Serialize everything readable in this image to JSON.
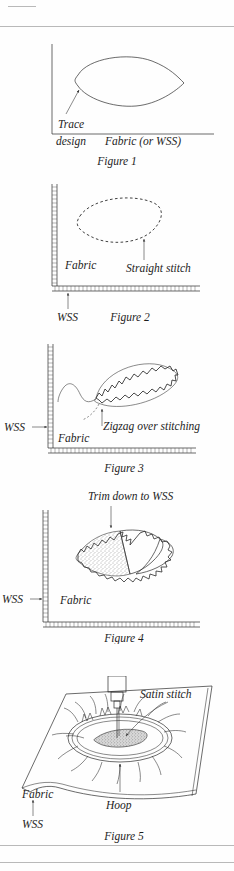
{
  "page": {
    "background": "#fefefe",
    "ink_color": "#2b2b2b",
    "rules": [
      {
        "name": "top-short-rule",
        "x": 8,
        "y": 6,
        "width": 28
      },
      {
        "name": "top-full-rule",
        "x": 0,
        "y": 26,
        "width": 234
      },
      {
        "name": "bottom-rule-1",
        "x": 0,
        "y": 845,
        "width": 234
      },
      {
        "name": "bottom-rule-2",
        "x": 0,
        "y": 862,
        "width": 234
      }
    ]
  },
  "figures": [
    {
      "id": "figure-1",
      "caption": "Figure 1",
      "labels": {
        "trace_line1": "Trace",
        "trace_line2": "design",
        "fabric": "Fabric (or WSS)"
      },
      "shape": "leaf-outline-solid",
      "edge_style": "plain-thin-lines",
      "arrows": [
        "trace-design-arrow-to-leaf"
      ]
    },
    {
      "id": "figure-2",
      "caption": "Figure 2",
      "labels": {
        "fabric": "Fabric",
        "straight_stitch": "Straight stitch",
        "wss": "WSS"
      },
      "shape": "leaf-outline-dashed",
      "edge_style": "hatched-double-lines",
      "arrows": [
        "straight-stitch-arrow-up",
        "wss-arrow-up"
      ]
    },
    {
      "id": "figure-3",
      "caption": "Figure 3",
      "labels": {
        "wss": "WSS",
        "fabric": "Fabric",
        "zigzag": "Zigzag over stitching"
      },
      "shape": "leaf-outline-zigzag",
      "edge_style": "hatched-double-lines",
      "arrows": [
        "wss-arrow-right",
        "zigzag-arrow-up"
      ]
    },
    {
      "id": "figure-4",
      "caption": "Figure 4",
      "labels": {
        "trim": "Trim down to WSS",
        "wss": "WSS",
        "fabric": "Fabric"
      },
      "shape": "leaf-zigzag-with-stippled-half-and-flap",
      "edge_style": "hatched-double-lines",
      "arrows": [
        "trim-arrow-down",
        "wss-arrow-right"
      ]
    },
    {
      "id": "figure-5",
      "caption": "Figure 5",
      "labels": {
        "satin_stitch": "Satin stitch",
        "fabric": "Fabric",
        "hoop": "Hoop",
        "wss": "WSS"
      },
      "shape": "fabric-sheet-perspective-with-hoop-and-needle",
      "arrows": [
        "satin-stitch-arrow-to-needle",
        "hoop-arrow-up",
        "wss-arrow-up"
      ]
    }
  ]
}
